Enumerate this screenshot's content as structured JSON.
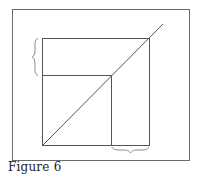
{
  "caption": "Figure 6",
  "colors": {
    "background": "#ffffff",
    "frame": "#6a6a6a",
    "lines": "#555555",
    "brace": "#8a8a8a",
    "caption": "#222222"
  },
  "diagram": {
    "outer_frame": {
      "x1": 12,
      "y1": 9,
      "x2": 189,
      "y2": 160
    },
    "inner_square": {
      "x1": 42,
      "y1": 38,
      "x2": 149,
      "y2": 145
    },
    "diagonal": {
      "x1": 42,
      "y1": 145,
      "x2": 163,
      "y2": 24
    },
    "intersection_point": {
      "x": 111,
      "y": 75
    },
    "horizontal_guide": {
      "x1": 42,
      "y1": 75,
      "x2": 111,
      "y2": 75
    },
    "vertical_guide": {
      "x1": 111,
      "y1": 75,
      "x2": 111,
      "y2": 145
    },
    "left_brace": {
      "x": 36,
      "y1": 38,
      "y2": 75,
      "tip_x": 32
    },
    "bottom_brace": {
      "y": 147,
      "x1": 112,
      "x2": 149,
      "tip_y": 153
    }
  }
}
